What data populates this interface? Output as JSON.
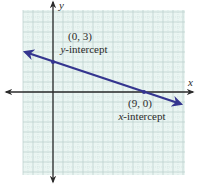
{
  "chart_data": {
    "type": "line",
    "title": "",
    "xlabel": "x",
    "ylabel": "y",
    "xlim": [
      -3,
      13
    ],
    "ylim": [
      -8,
      8
    ],
    "grid": true,
    "series": [
      {
        "name": "line",
        "color": "#34358f",
        "points": [
          [
            -3,
            4
          ],
          [
            0,
            3
          ],
          [
            9,
            0
          ],
          [
            12.9,
            -1.3
          ]
        ]
      }
    ],
    "annotations": [
      {
        "point": [
          0,
          3
        ],
        "coord_label": "(0, 3)",
        "desc_var": "y",
        "desc_rest": "-intercept"
      },
      {
        "point": [
          9,
          0
        ],
        "coord_label": "(9, 0)",
        "desc_var": "x",
        "desc_rest": "-intercept"
      }
    ]
  },
  "labels": {
    "x_axis": "x",
    "y_axis": "y",
    "y_int_coord": "(0, 3)",
    "y_int_var": "y",
    "y_int_rest": "-intercept",
    "x_int_coord": "(9, 0)",
    "x_int_var": "x",
    "x_int_rest": "-intercept"
  },
  "colors": {
    "grid_bg": "#eaf5f2",
    "grid_major": "#b9cfcb",
    "grid_minor": "#cfdfdc",
    "axis": "#2b2b2b",
    "line": "#34358f"
  }
}
